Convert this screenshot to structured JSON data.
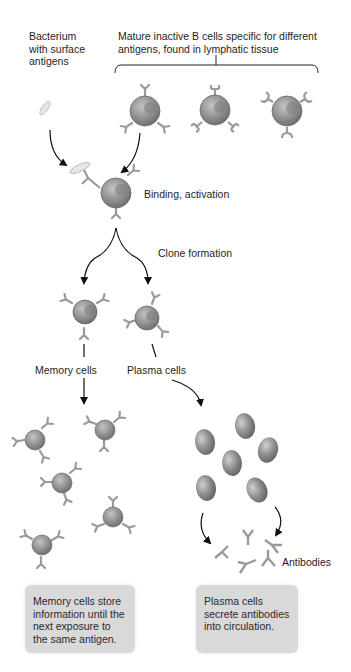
{
  "labels": {
    "bacterium": "Bacterium\nwith surface\nantigens",
    "mature_cells": "Mature inactive B cells specific for different\nantigens, found in lymphatic tissue",
    "binding": "Binding, activation",
    "clone": "Clone formation",
    "memory": "Memory cells",
    "plasma": "Plasma cells",
    "antibodies": "Antibodies"
  },
  "notes": {
    "memory": "Memory cells store\ninformation until the\nnext exposure to\nthe same antigen.",
    "plasma": "Plasma cells\nsecrete antibodies\ninto circulation."
  },
  "colors": {
    "cell_fill": "#8f8f8f",
    "cell_dark": "#6a6a6a",
    "receptor": "#9a9a9a",
    "note_bg": "#d9d9d9",
    "arrow": "#111111"
  }
}
